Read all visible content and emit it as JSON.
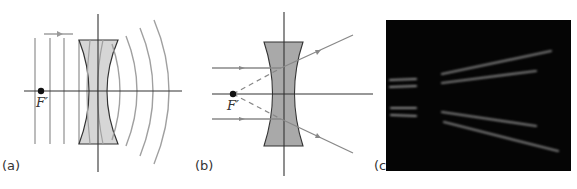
{
  "panels": [
    {
      "id": "a",
      "label": "(a)",
      "focal_point_label": "F′",
      "description": "Plane wavefronts incident from the left on a diverging (concave) lens, emerging as diverging spherical wavefronts",
      "incident_direction_arrow": "right"
    },
    {
      "id": "b",
      "label": "(b)",
      "focal_point_label": "F′",
      "description": "Parallel rays refracted by a diverging lens appear to originate from the virtual focal point F′ (dashed extensions)"
    },
    {
      "id": "c",
      "label": "(c)",
      "description": "Photograph of light beams diverging after passing through a concave lens"
    }
  ],
  "colors": {
    "lens_fill_a": "#d6d6d6",
    "lens_fill_b": "#a9a9a9",
    "wavefront": "#9a9a9a",
    "ray": "#8c8c8c",
    "axis": "#333333",
    "focal_dot": "#111111",
    "photo_bg": "#050505",
    "beam": "#8a8a8a"
  }
}
